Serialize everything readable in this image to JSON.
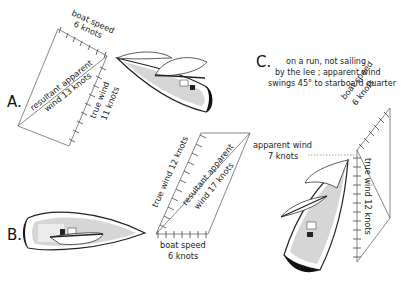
{
  "panels": {
    "A": {
      "letter": "A.",
      "boat_speed": {
        "line1": "boat speed",
        "line2": "6 knots",
        "value": 6
      },
      "true_wind": {
        "line1": "true wind",
        "line2": "11 knots",
        "value": 11
      },
      "apparent_wind": {
        "line1": "resultant apparent",
        "line2": "wind 13 knots",
        "value": 13
      }
    },
    "B": {
      "letter": "B.",
      "boat_speed": {
        "line1": "boat speed",
        "line2": "6 knots",
        "value": 6
      },
      "true_wind": {
        "text": "true wind 12 knots",
        "value": 12
      },
      "apparent_wind": {
        "line1": "resultant apparent",
        "line2": "wind 17 knots",
        "value": 17
      }
    },
    "C": {
      "letter": "C.",
      "caption": {
        "line1": "on a run, not sailing",
        "line2": "by the lee ; apparent wind",
        "line3": "swings 45° to starboard quarter"
      },
      "boat_speed": {
        "line1": "boat speed",
        "line2": "6 knots",
        "value": 6
      },
      "true_wind": {
        "text": "true wind 12 knots",
        "value": 12
      },
      "apparent_wind": {
        "line1": "apparent wind",
        "line2": "7 knots",
        "value": 7
      }
    }
  }
}
